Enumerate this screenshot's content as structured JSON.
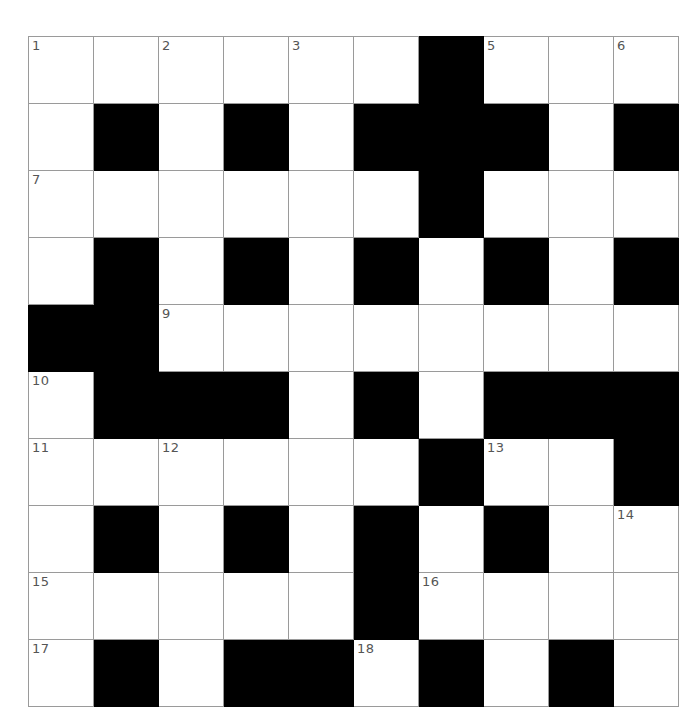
{
  "puzzle": {
    "title": "",
    "type": "crossword-grid",
    "rows": 10,
    "cols": 10,
    "cell_size_px": 64,
    "colors": {
      "block": "#000000",
      "cell": "#ffffff",
      "gridline": "#9a9a9a",
      "number_text": "#555555",
      "page_background": "#ffffff"
    },
    "legend": {
      "block_char": "#",
      "open_char": "."
    },
    "grid": [
      "......#...",
      ".#.#.###.#",
      "......#...",
      ".#.#.#.#.#",
      "##........",
      ".###.#.###",
      "......#..#",
      ".#.#.#.#..",
      ".....#....",
      ".#.##.#.#."
    ],
    "numbers": [
      {
        "n": 1,
        "row": 1,
        "col": 1
      },
      {
        "n": 2,
        "row": 1,
        "col": 3
      },
      {
        "n": 3,
        "row": 1,
        "col": 5
      },
      {
        "n": 4,
        "row": 1,
        "col": 7
      },
      {
        "n": 5,
        "row": 1,
        "col": 8
      },
      {
        "n": 6,
        "row": 1,
        "col": 10
      },
      {
        "n": 7,
        "row": 3,
        "col": 1
      },
      {
        "n": 8,
        "row": 3,
        "col": 7
      },
      {
        "n": 9,
        "row": 5,
        "col": 3
      },
      {
        "n": 10,
        "row": 6,
        "col": 1
      },
      {
        "n": 11,
        "row": 7,
        "col": 1
      },
      {
        "n": 12,
        "row": 7,
        "col": 3
      },
      {
        "n": 13,
        "row": 7,
        "col": 8
      },
      {
        "n": 14,
        "row": 8,
        "col": 10
      },
      {
        "n": 15,
        "row": 9,
        "col": 1
      },
      {
        "n": 16,
        "row": 9,
        "col": 7
      },
      {
        "n": 17,
        "row": 10,
        "col": 1
      },
      {
        "n": 18,
        "row": 10,
        "col": 6
      }
    ]
  }
}
